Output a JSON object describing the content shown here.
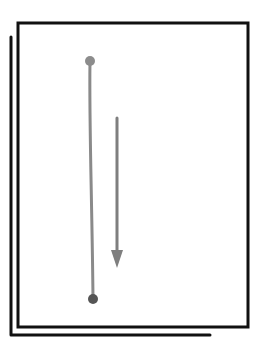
{
  "diagram": {
    "colors": {
      "background": "#ffffff",
      "frame": "#111111",
      "line": "#8a8a8a",
      "endpoint_top": "#8c8c8c",
      "endpoint_bottom": "#555555",
      "arrow": "#7f7f7f"
    },
    "front_frame": {
      "x1": 17,
      "y1": 22,
      "x2": 248,
      "y2": 327
    },
    "back_frame": {
      "left_x": 11,
      "top_y": 37,
      "bottom_y": 335,
      "right_x": 210
    },
    "segment": {
      "start": {
        "x": 90,
        "y": 61
      },
      "end": {
        "x": 93,
        "y": 299
      },
      "start_radius": 5,
      "end_radius": 5
    },
    "arrow": {
      "x": 117,
      "y_start": 118,
      "y_end": 267,
      "direction": "down"
    }
  }
}
